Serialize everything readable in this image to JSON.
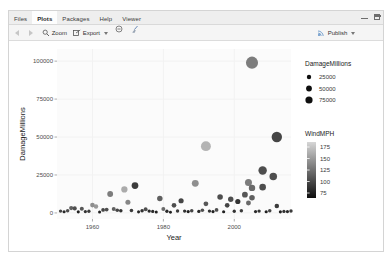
{
  "window": {
    "minimize_icon": "minimize-icon",
    "maximize_icon": "maximize-icon"
  },
  "tabs": [
    {
      "label": "Files",
      "active": false
    },
    {
      "label": "Plots",
      "active": true
    },
    {
      "label": "Packages",
      "active": false
    },
    {
      "label": "Help",
      "active": false
    },
    {
      "label": "Viewer",
      "active": false
    }
  ],
  "toolbar": {
    "back_icon": "back-arrow-icon",
    "forward_icon": "forward-arrow-icon",
    "zoom_label": "Zoom",
    "zoom_icon": "magnifier-icon",
    "export_label": "Export",
    "export_icon": "export-icon",
    "export_caret": "chevron-down-icon",
    "remove_icon": "remove-plot-icon",
    "clear_icon": "clear-all-plots-icon",
    "publish_label": "Publish",
    "publish_icon": "publish-icon",
    "publish_caret": "chevron-down-icon"
  },
  "chart_data": {
    "type": "scatter",
    "title": "",
    "xlabel": "Year",
    "ylabel": "DamageMillions",
    "xlim": [
      1950,
      2016
    ],
    "ylim": [
      -4000,
      108000
    ],
    "xticks": [
      1960,
      1980,
      2000
    ],
    "yticks": [
      0,
      25000,
      50000,
      75000,
      100000
    ],
    "ytick_labels": [
      "0",
      "25000",
      "50000",
      "75000",
      "100000"
    ],
    "xtick_labels": [
      "1960",
      "1980",
      "2000"
    ],
    "grid": true,
    "panel_background": "#fbfbfb",
    "grid_color": "#f2f2f2",
    "legends": [
      {
        "name": "size-legend",
        "title": "DamageMillions",
        "type": "size",
        "entries": [
          {
            "label": "25000",
            "radius": 2.2
          },
          {
            "label": "50000",
            "radius": 2.9
          },
          {
            "label": "75000",
            "radius": 3.6
          }
        ]
      },
      {
        "name": "color-legend",
        "title": "WindMPH",
        "type": "colorbar",
        "ticks": [
          "175",
          "150",
          "125",
          "100",
          "75"
        ],
        "high_color": "#d6d6d6",
        "low_color": "#0d0d0d"
      }
    ],
    "points": [
      {
        "x": 2005,
        "y": 99000,
        "size": 75000,
        "wind": 125
      },
      {
        "x": 1992,
        "y": 44000,
        "size": 46000,
        "wind": 155
      },
      {
        "x": 2012,
        "y": 50000,
        "size": 52000,
        "wind": 95
      },
      {
        "x": 2008,
        "y": 28000,
        "size": 30000,
        "wind": 100
      },
      {
        "x": 2011,
        "y": 24000,
        "size": 22000,
        "wind": 100
      },
      {
        "x": 2004,
        "y": 20000,
        "size": 18000,
        "wind": 125
      },
      {
        "x": 1989,
        "y": 19500,
        "size": 17000,
        "wind": 135
      },
      {
        "x": 1972,
        "y": 18000,
        "size": 16000,
        "wind": 90
      },
      {
        "x": 2008,
        "y": 17000,
        "size": 15000,
        "wind": 100
      },
      {
        "x": 2005,
        "y": 16500,
        "size": 14000,
        "wind": 115
      },
      {
        "x": 1969,
        "y": 15500,
        "size": 13000,
        "wind": 150
      },
      {
        "x": 2003,
        "y": 12000,
        "size": 10000,
        "wind": 105
      },
      {
        "x": 1965,
        "y": 12500,
        "size": 10500,
        "wind": 125
      },
      {
        "x": 1996,
        "y": 10500,
        "size": 9000,
        "wind": 100
      },
      {
        "x": 2005,
        "y": 10000,
        "size": 9000,
        "wind": 110
      },
      {
        "x": 1999,
        "y": 9000,
        "size": 8000,
        "wind": 100
      },
      {
        "x": 1979,
        "y": 9500,
        "size": 8500,
        "wind": 110
      },
      {
        "x": 1985,
        "y": 8000,
        "size": 7000,
        "wind": 95
      },
      {
        "x": 2001,
        "y": 7500,
        "size": 7000,
        "wind": 85
      },
      {
        "x": 1970,
        "y": 7000,
        "size": 6500,
        "wind": 130
      },
      {
        "x": 2004,
        "y": 6500,
        "size": 6000,
        "wind": 115
      },
      {
        "x": 1992,
        "y": 6000,
        "size": 5500,
        "wind": 105
      },
      {
        "x": 1983,
        "y": 5000,
        "size": 5000,
        "wind": 100
      },
      {
        "x": 1998,
        "y": 5000,
        "size": 5000,
        "wind": 95
      },
      {
        "x": 2012,
        "y": 4500,
        "size": 4500,
        "wind": 90
      },
      {
        "x": 1960,
        "y": 5200,
        "size": 5000,
        "wind": 135
      },
      {
        "x": 1961,
        "y": 4200,
        "size": 4000,
        "wind": 140
      },
      {
        "x": 1955,
        "y": 3000,
        "size": 3000,
        "wind": 100
      },
      {
        "x": 1954,
        "y": 3200,
        "size": 3200,
        "wind": 110
      },
      {
        "x": 1957,
        "y": 2800,
        "size": 2800,
        "wind": 105
      },
      {
        "x": 1963,
        "y": 2000,
        "size": 2000,
        "wind": 95
      },
      {
        "x": 1964,
        "y": 2200,
        "size": 2200,
        "wind": 100
      },
      {
        "x": 1966,
        "y": 2600,
        "size": 2600,
        "wind": 110
      },
      {
        "x": 1967,
        "y": 1800,
        "size": 1800,
        "wind": 95
      },
      {
        "x": 1968,
        "y": 1500,
        "size": 1500,
        "wind": 85
      },
      {
        "x": 1971,
        "y": 1600,
        "size": 1600,
        "wind": 90
      },
      {
        "x": 1974,
        "y": 1400,
        "size": 1400,
        "wind": 85
      },
      {
        "x": 1975,
        "y": 2400,
        "size": 2400,
        "wind": 100
      },
      {
        "x": 1976,
        "y": 1200,
        "size": 1200,
        "wind": 80
      },
      {
        "x": 1977,
        "y": 1000,
        "size": 1000,
        "wind": 80
      },
      {
        "x": 1980,
        "y": 2600,
        "size": 2600,
        "wind": 115
      },
      {
        "x": 1981,
        "y": 1100,
        "size": 1100,
        "wind": 80
      },
      {
        "x": 1984,
        "y": 1300,
        "size": 1300,
        "wind": 90
      },
      {
        "x": 1986,
        "y": 1200,
        "size": 1200,
        "wind": 85
      },
      {
        "x": 1987,
        "y": 900,
        "size": 900,
        "wind": 75
      },
      {
        "x": 1988,
        "y": 1500,
        "size": 1500,
        "wind": 95
      },
      {
        "x": 1990,
        "y": 1000,
        "size": 1000,
        "wind": 80
      },
      {
        "x": 1991,
        "y": 1800,
        "size": 1800,
        "wind": 100
      },
      {
        "x": 1993,
        "y": 1200,
        "size": 1200,
        "wind": 85
      },
      {
        "x": 1994,
        "y": 900,
        "size": 900,
        "wind": 75
      },
      {
        "x": 1995,
        "y": 2000,
        "size": 2000,
        "wind": 100
      },
      {
        "x": 1997,
        "y": 800,
        "size": 800,
        "wind": 75
      },
      {
        "x": 2000,
        "y": 1100,
        "size": 1100,
        "wind": 85
      },
      {
        "x": 2002,
        "y": 1400,
        "size": 1400,
        "wind": 90
      },
      {
        "x": 2006,
        "y": 900,
        "size": 900,
        "wind": 80
      },
      {
        "x": 2007,
        "y": 1200,
        "size": 1200,
        "wind": 85
      },
      {
        "x": 2009,
        "y": 800,
        "size": 800,
        "wind": 75
      },
      {
        "x": 2010,
        "y": 1500,
        "size": 1500,
        "wind": 95
      },
      {
        "x": 2013,
        "y": 700,
        "size": 700,
        "wind": 75
      },
      {
        "x": 2014,
        "y": 1000,
        "size": 1000,
        "wind": 85
      },
      {
        "x": 2015,
        "y": 900,
        "size": 900,
        "wind": 80
      },
      {
        "x": 1951,
        "y": 1200,
        "size": 1200,
        "wind": 95
      },
      {
        "x": 1952,
        "y": 800,
        "size": 800,
        "wind": 80
      },
      {
        "x": 1953,
        "y": 1500,
        "size": 1500,
        "wind": 100
      },
      {
        "x": 1956,
        "y": 700,
        "size": 700,
        "wind": 75
      },
      {
        "x": 1958,
        "y": 900,
        "size": 900,
        "wind": 85
      },
      {
        "x": 1959,
        "y": 1100,
        "size": 1100,
        "wind": 90
      },
      {
        "x": 1962,
        "y": 600,
        "size": 600,
        "wind": 75
      },
      {
        "x": 1973,
        "y": 700,
        "size": 700,
        "wind": 80
      },
      {
        "x": 1978,
        "y": 600,
        "size": 600,
        "wind": 75
      },
      {
        "x": 1982,
        "y": 500,
        "size": 500,
        "wind": 75
      },
      {
        "x": 2016,
        "y": 1300,
        "size": 1300,
        "wind": 90
      }
    ]
  }
}
